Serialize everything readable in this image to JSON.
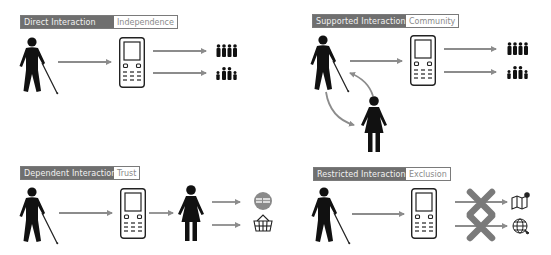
{
  "diagram": {
    "panels": [
      {
        "id": "direct",
        "title": "Direct Interaction",
        "outcome": "Independence",
        "flow": [
          "blind-person-with-cane",
          "mobile-phone",
          [
            "community-group",
            "family-group"
          ]
        ]
      },
      {
        "id": "supported",
        "title": "Supported Interaction",
        "outcome": "Community",
        "flow": [
          "blind-person-with-cane",
          "mobile-phone",
          [
            "community-group",
            "family-group"
          ]
        ],
        "helper": "woman-supporter (bidirectional exchange with person)"
      },
      {
        "id": "dependent",
        "title": "Dependent Interaction",
        "outcome": "Trust",
        "flow": [
          "blind-person-with-cane",
          "mobile-phone",
          "woman-intermediary",
          [
            "money-payment",
            "shopping-basket"
          ]
        ]
      },
      {
        "id": "restricted",
        "title": "Restricted Interaction",
        "outcome": "Exclusion",
        "flow": [
          "blind-person-with-cane",
          "mobile-phone",
          [
            "map (blocked)",
            "globe-web (blocked)"
          ]
        ]
      }
    ],
    "colors": {
      "header_dark": "#6f6f6f",
      "header_text": "#f2f2f2",
      "outcome_text": "#8a8a8a",
      "arrow": "#8c8c8c",
      "cross": "#7a7a7a",
      "figure": "#111111",
      "coin": "#8a8a8a"
    }
  }
}
